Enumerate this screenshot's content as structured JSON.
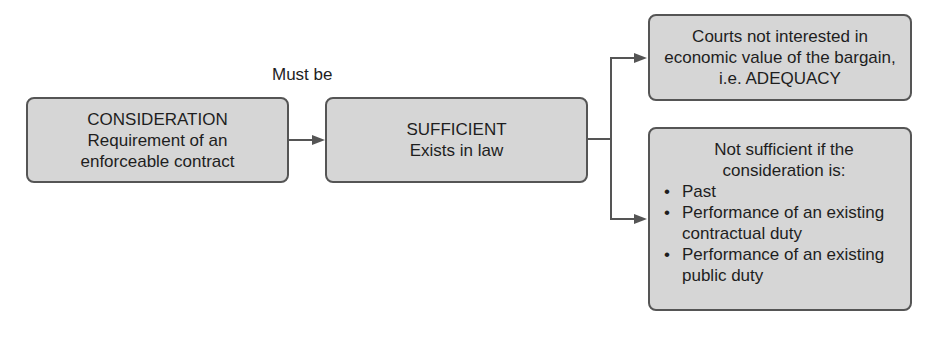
{
  "diagram": {
    "nodes": {
      "consideration": {
        "title": "CONSIDERATION",
        "line2": "Requirement of an",
        "line3": "enforceable contract"
      },
      "sufficient": {
        "title": "SUFFICIENT",
        "line2": "Exists in law"
      },
      "adequacy": {
        "line1": "Courts not interested in",
        "line2": "economic value of the bargain,",
        "line3": "i.e. ADEQUACY"
      },
      "not_sufficient": {
        "line1": "Not sufficient  if the",
        "line2": "consideration is:",
        "bullets": [
          {
            "line1": "Past",
            "line2": ""
          },
          {
            "line1": "Performance of an existing",
            "line2": "contractual duty"
          },
          {
            "line1": "Performance of an existing",
            "line2": "public duty"
          }
        ]
      }
    },
    "edge_label": "Must be"
  }
}
